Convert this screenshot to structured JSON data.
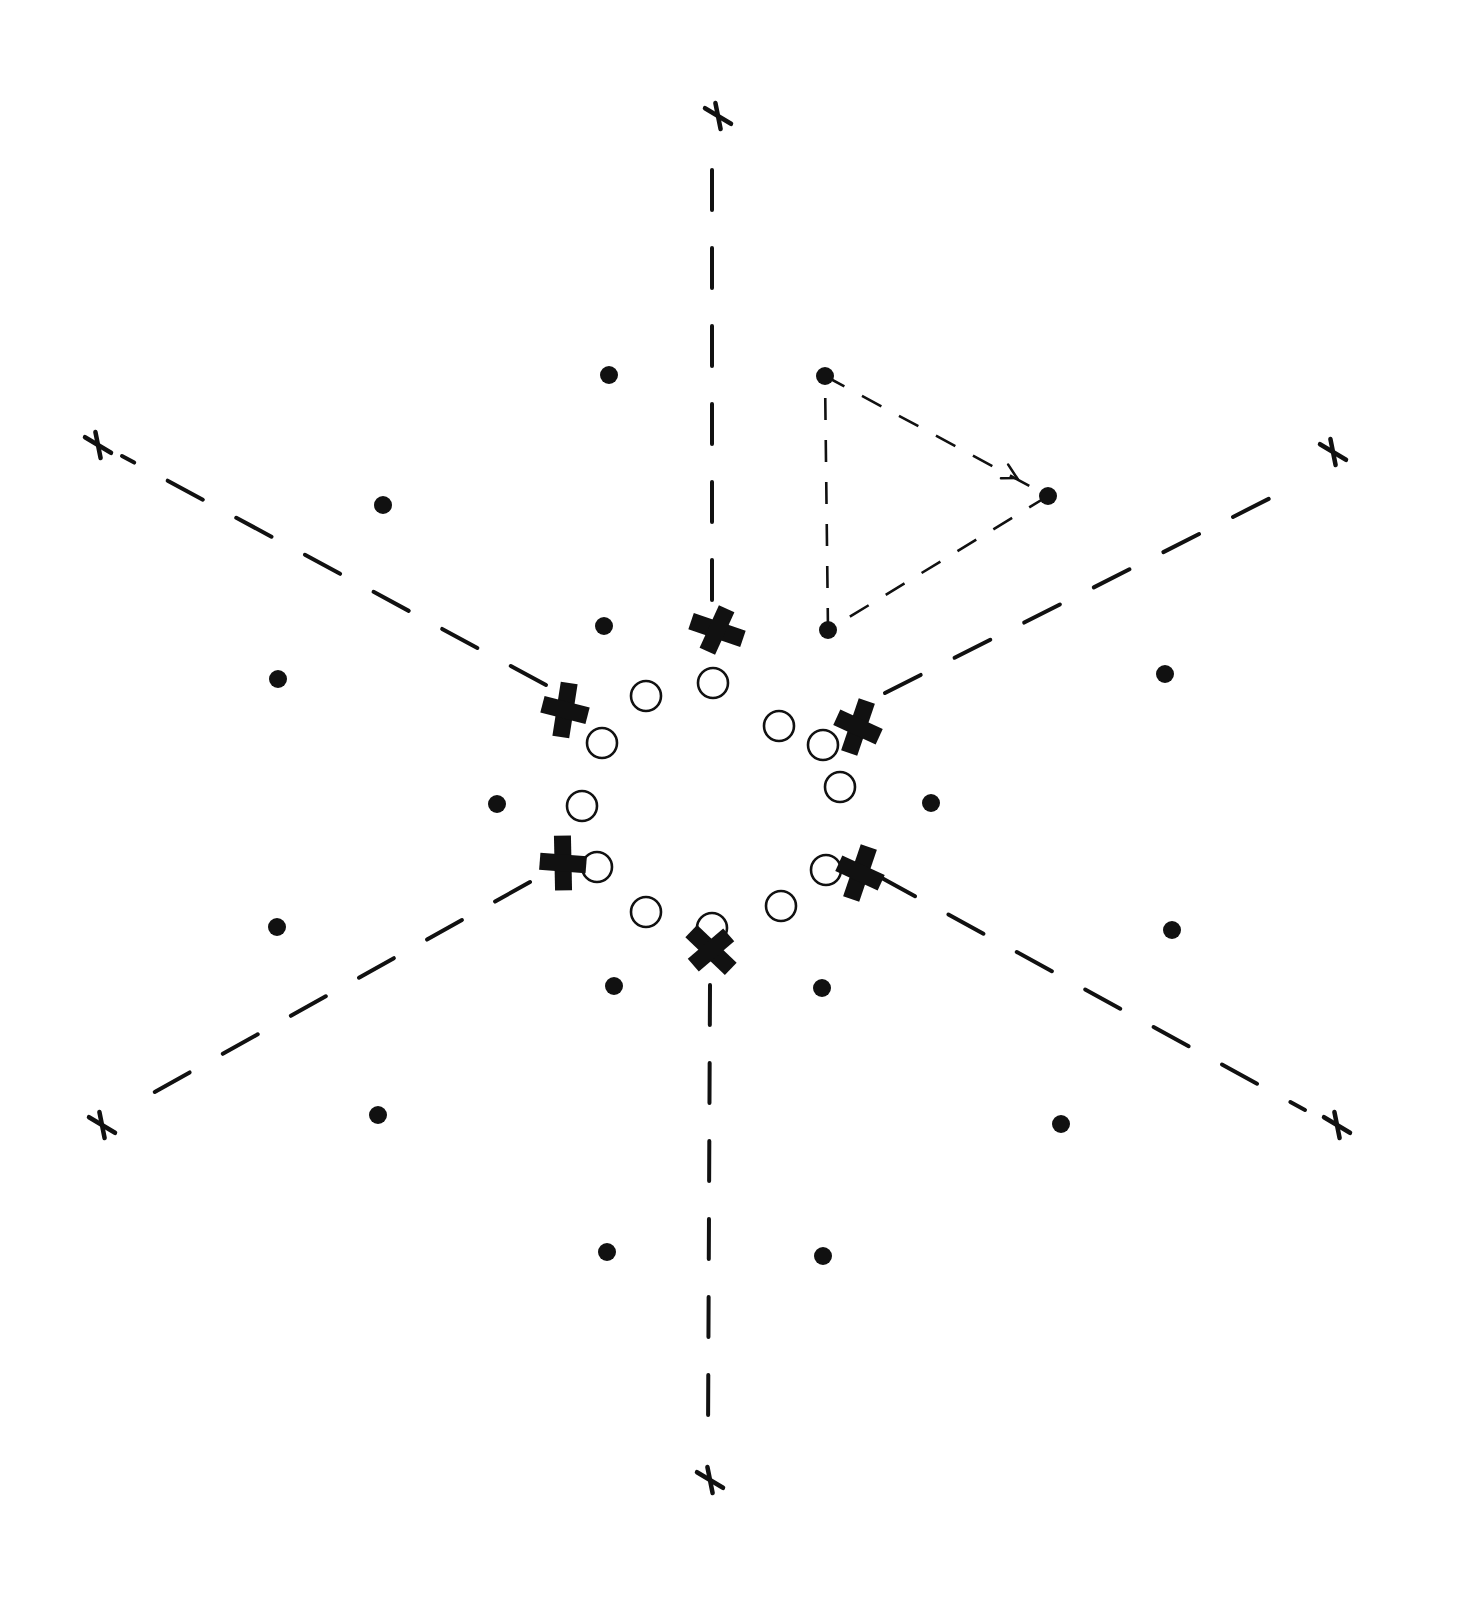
{
  "diagram": {
    "title": "",
    "center": [
      712,
      790
    ],
    "colors": {
      "ink": "#111111",
      "background": "#ffffff"
    },
    "axes": [
      {
        "name": "axis-top",
        "from": [
          712,
          600
        ],
        "to": [
          712,
          150
        ],
        "end_mark": [
          718,
          116
        ]
      },
      {
        "name": "axis-bottom",
        "from": [
          710,
          985
        ],
        "to": [
          708,
          1440
        ],
        "end_mark": [
          710,
          1480
        ]
      },
      {
        "name": "axis-upper-left",
        "from": [
          546,
          685
        ],
        "to": [
          122,
          456
        ],
        "end_mark": [
          98,
          445
        ]
      },
      {
        "name": "axis-upper-right",
        "from": [
          885,
          693
        ],
        "to": [
          1300,
          483
        ],
        "end_mark": [
          1333,
          452
        ]
      },
      {
        "name": "axis-lower-left",
        "from": [
          530,
          882
        ],
        "to": [
          135,
          1103
        ],
        "end_mark": [
          102,
          1125
        ]
      },
      {
        "name": "axis-lower-right",
        "from": [
          880,
          877
        ],
        "to": [
          1305,
          1110
        ],
        "end_mark": [
          1337,
          1125
        ]
      }
    ],
    "bold_x_marks": [
      {
        "name": "bold-x-top",
        "pos": [
          717,
          630
        ]
      },
      {
        "name": "bold-x-upper-left",
        "pos": [
          565,
          710
        ]
      },
      {
        "name": "bold-x-upper-right",
        "pos": [
          858,
          727
        ]
      },
      {
        "name": "bold-x-lower-left",
        "pos": [
          563,
          863
        ]
      },
      {
        "name": "bold-x-lower-right",
        "pos": [
          860,
          873
        ]
      },
      {
        "name": "bold-x-bottom",
        "pos": [
          711,
          950
        ]
      }
    ],
    "open_circles": [
      [
        713,
        683
      ],
      [
        779,
        726
      ],
      [
        823,
        745
      ],
      [
        840,
        787
      ],
      [
        826,
        870
      ],
      [
        781,
        906
      ],
      [
        712,
        928
      ],
      [
        646,
        912
      ],
      [
        597,
        867
      ],
      [
        582,
        806
      ],
      [
        602,
        743
      ],
      [
        646,
        696
      ]
    ],
    "open_circle_radius": 15,
    "dots": [
      [
        609,
        375
      ],
      [
        383,
        505
      ],
      [
        604,
        626
      ],
      [
        278,
        679
      ],
      [
        1165,
        674
      ],
      [
        497,
        804
      ],
      [
        931,
        803
      ],
      [
        277,
        927
      ],
      [
        1172,
        930
      ],
      [
        614,
        986
      ],
      [
        822,
        988
      ],
      [
        378,
        1115
      ],
      [
        1061,
        1124
      ],
      [
        607,
        1252
      ],
      [
        823,
        1256
      ]
    ],
    "dot_radius": 9,
    "triangle": {
      "vertices": [
        [
          825,
          376
        ],
        [
          1048,
          496
        ],
        [
          828,
          630
        ]
      ],
      "arrow_on_edge": "from vertex 0 toward vertex 1",
      "arrow_tip": [
        1017,
        478
      ]
    },
    "labels": []
  }
}
